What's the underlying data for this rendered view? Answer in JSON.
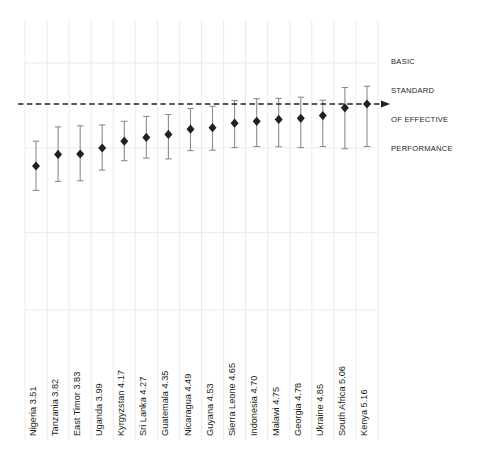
{
  "chart_data": {
    "type": "scatter",
    "title": "",
    "subtitle": "",
    "xlabel": "",
    "ylabel": "",
    "grid": true,
    "legend_position": "none",
    "ylim": [
      2.4,
      6.1
    ],
    "reference_line": {
      "label_lines": [
        "BASIC",
        "STANDARD",
        "OF EFFECTIVE",
        "PERFORMANCE"
      ],
      "label_text": "BASIC STANDARD OF EFFECTIVE PERFORMANCE",
      "value": 5.16,
      "style": "dashed",
      "color": "#231f20",
      "arrow": true
    },
    "marker": {
      "shape": "diamond",
      "color": "#231f20",
      "errorbar_color": "#808080",
      "errorbar_cap": true
    },
    "categories": [
      "Nigeria",
      "Tanzania",
      "East Timor",
      "Uganda",
      "Kyrgyzstan",
      "Sri Lanka",
      "Guatemala",
      "Nicaragua",
      "Guyana",
      "Sierra Leone",
      "Indonesia",
      "Malawi",
      "Georgia",
      "Ukraine",
      "South Africa",
      "Kenya"
    ],
    "values": [
      3.51,
      3.82,
      3.83,
      3.99,
      4.17,
      4.27,
      4.35,
      4.49,
      4.53,
      4.65,
      4.7,
      4.75,
      4.78,
      4.85,
      5.06,
      5.16
    ],
    "ci_low": [
      2.86,
      3.1,
      3.12,
      3.4,
      3.65,
      3.72,
      3.7,
      3.92,
      3.93,
      4.0,
      4.03,
      4.02,
      4.0,
      4.03,
      3.97,
      4.03
    ],
    "ci_high": [
      4.17,
      4.55,
      4.58,
      4.6,
      4.7,
      4.83,
      4.88,
      5.04,
      5.1,
      5.25,
      5.3,
      5.31,
      5.34,
      5.26,
      5.6,
      5.63
    ],
    "points": [
      {
        "label": "Nigeria",
        "value": 3.51,
        "ci_low": 2.86,
        "ci_high": 4.17
      },
      {
        "label": "Tanzania",
        "value": 3.82,
        "ci_low": 3.1,
        "ci_high": 4.55
      },
      {
        "label": "East Timor",
        "value": 3.83,
        "ci_low": 3.12,
        "ci_high": 4.58
      },
      {
        "label": "Uganda",
        "value": 3.99,
        "ci_low": 3.4,
        "ci_high": 4.6
      },
      {
        "label": "Kyrgyzstan",
        "value": 4.17,
        "ci_low": 3.65,
        "ci_high": 4.7
      },
      {
        "label": "Sri Lanka",
        "value": 4.27,
        "ci_low": 3.72,
        "ci_high": 4.83
      },
      {
        "label": "Guatemala",
        "value": 4.35,
        "ci_low": 3.7,
        "ci_high": 4.88
      },
      {
        "label": "Nicaragua",
        "value": 4.49,
        "ci_low": 3.92,
        "ci_high": 5.04
      },
      {
        "label": "Guyana",
        "value": 4.53,
        "ci_low": 3.93,
        "ci_high": 5.1
      },
      {
        "label": "Sierra Leone",
        "value": 4.65,
        "ci_low": 4.0,
        "ci_high": 5.25
      },
      {
        "label": "Indonesia",
        "value": 4.7,
        "ci_low": 4.03,
        "ci_high": 5.3
      },
      {
        "label": "Malawi",
        "value": 4.75,
        "ci_low": 4.02,
        "ci_high": 5.31
      },
      {
        "label": "Georgia",
        "value": 4.78,
        "ci_low": 4.0,
        "ci_high": 5.34
      },
      {
        "label": "Ukraine",
        "value": 4.85,
        "ci_low": 4.03,
        "ci_high": 5.26
      },
      {
        "label": "South Africa",
        "value": 5.06,
        "ci_low": 3.97,
        "ci_high": 5.6
      },
      {
        "label": "Kenya",
        "value": 5.16,
        "ci_low": 4.03,
        "ci_high": 5.63
      }
    ],
    "tick_labels": [
      "Nigeria  3.51",
      "Tanzania  3.82",
      "East Timor  3.83",
      "Uganda  3.99",
      "Kyrgyzstan  4.17",
      "Sri Lanka  4.27",
      "Guatemala  4.35",
      "Nicaragua  4.49",
      "Guyana  4.53",
      "Sierra Leone  4.65",
      "Indonesia  4.70",
      "Malawi  4.75",
      "Georgia  4.78",
      "Ukraine  4.85",
      "South Africa  5.06",
      "Kenya  5.16"
    ]
  },
  "colors": {
    "marker": "#231f20",
    "errorbar": "#8c8c8c",
    "grid": "#ebebeb",
    "reference": "#231f20",
    "text": "#231f20",
    "background": "#ffffff"
  },
  "annotation": {
    "line1": "BASIC",
    "line2": "STANDARD",
    "line3": "OF EFFECTIVE",
    "line4": "PERFORMANCE"
  }
}
